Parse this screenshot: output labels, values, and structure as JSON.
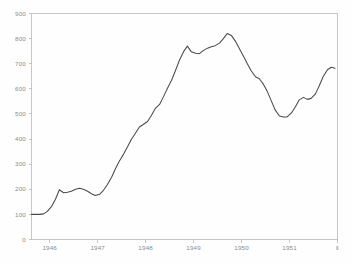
{
  "chart_data": {
    "type": "line",
    "title": "",
    "subtitle": "",
    "xlabel": "",
    "ylabel": "",
    "grid": false,
    "legend": null,
    "legend_position": "none",
    "xlim": [
      1945.62,
      1952.0
    ],
    "ylim": [
      0,
      900
    ],
    "y_ticks": [
      0,
      100,
      200,
      300,
      400,
      500,
      600,
      700,
      800,
      900
    ],
    "y_tick_labels": [
      "0",
      "100",
      "200",
      "300",
      "400",
      "500",
      "600",
      "700",
      "800",
      "900"
    ],
    "x_ticks": [
      1946,
      1947,
      1948,
      1949,
      1950,
      1951,
      1952
    ],
    "x_tick_labels": [
      "1946",
      "1947",
      "1948",
      "1949",
      "1950",
      "1951",
      "‖"
    ],
    "line_color": "#4a4a4a",
    "axis_color": "#b9b9b9",
    "label_color": "#8a8a8a",
    "background_color": "#fefefe",
    "series": [
      {
        "name": "series-1",
        "x": [
          1945.62,
          1945.7,
          1945.79,
          1945.87,
          1945.95,
          1946.04,
          1946.12,
          1946.2,
          1946.29,
          1946.37,
          1946.45,
          1946.54,
          1946.62,
          1946.7,
          1946.79,
          1946.87,
          1946.95,
          1947.04,
          1947.12,
          1947.2,
          1947.29,
          1947.37,
          1947.45,
          1947.54,
          1947.62,
          1947.7,
          1947.79,
          1947.87,
          1947.95,
          1948.04,
          1948.12,
          1948.2,
          1948.29,
          1948.37,
          1948.45,
          1948.54,
          1948.62,
          1948.7,
          1948.79,
          1948.87,
          1948.95,
          1949.04,
          1949.12,
          1949.2,
          1949.29,
          1949.37,
          1949.45,
          1949.54,
          1949.62,
          1949.7,
          1949.79,
          1949.87,
          1949.95,
          1950.04,
          1950.12,
          1950.2,
          1950.29,
          1950.37,
          1950.45,
          1950.54,
          1950.62,
          1950.7,
          1950.79,
          1950.87,
          1950.95,
          1951.04,
          1951.12,
          1951.2,
          1951.29,
          1951.37,
          1951.45,
          1951.54,
          1951.62,
          1951.7,
          1951.79,
          1951.87,
          1951.95
        ],
        "values": [
          100,
          100,
          100,
          102,
          112,
          132,
          160,
          198,
          186,
          188,
          192,
          200,
          204,
          200,
          192,
          182,
          175,
          180,
          196,
          218,
          248,
          282,
          312,
          340,
          368,
          398,
          424,
          448,
          458,
          470,
          494,
          522,
          538,
          568,
          600,
          634,
          672,
          712,
          748,
          770,
          748,
          742,
          740,
          752,
          762,
          768,
          772,
          782,
          800,
          820,
          812,
          790,
          762,
          730,
          700,
          672,
          648,
          640,
          620,
          588,
          552,
          516,
          492,
          488,
          488,
          504,
          528,
          556,
          566,
          558,
          562,
          580,
          612,
          648,
          676,
          686,
          682
        ]
      }
    ],
    "annotations": [
      {
        "label": "start-plateau",
        "value": 100,
        "note": "flat at 100 through late 1945"
      },
      {
        "label": "first-local-peak",
        "value": 204,
        "note": "mid 1946"
      },
      {
        "label": "first-local-trough",
        "value": 175,
        "note": "late 1946"
      },
      {
        "label": "pre-peak-spike",
        "value": 770,
        "note": "late 1948"
      },
      {
        "label": "global-peak",
        "value": 820,
        "note": "late 1949"
      },
      {
        "label": "global-trough",
        "value": 488,
        "note": "late 1950"
      },
      {
        "label": "recovery-peak",
        "value": 686,
        "note": "late 1951"
      },
      {
        "label": "end-value",
        "value": 640,
        "note": "end of series"
      }
    ]
  }
}
